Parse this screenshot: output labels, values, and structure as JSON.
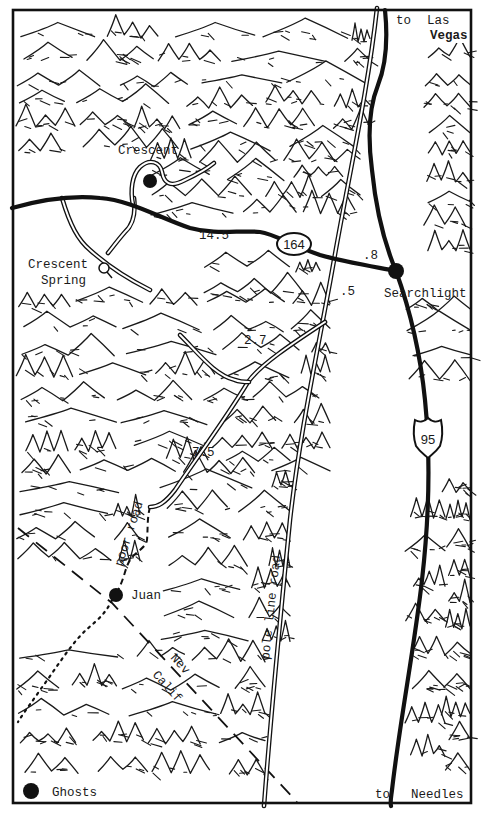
{
  "map": {
    "width": 487,
    "height": 814,
    "colors": {
      "ink": "#111111",
      "paper": "#ffffff"
    },
    "places": [
      {
        "id": "crescent",
        "label": "Crescent",
        "x": 147,
        "y": 181,
        "marker": "town",
        "label_x": 118,
        "label_y": 154
      },
      {
        "id": "crescent-spring",
        "label_lines": [
          "Crescent",
          "Spring"
        ],
        "x": 104,
        "y": 268,
        "marker": "spring",
        "label_x": 28,
        "label_y": 268
      },
      {
        "id": "searchlight",
        "label": "Searchlight",
        "x": 396,
        "y": 271,
        "marker": "town",
        "label_x": 383,
        "label_y": 297
      },
      {
        "id": "juan",
        "label": "Juan",
        "x": 116,
        "y": 595,
        "marker": "town",
        "label_x": 130,
        "label_y": 600
      },
      {
        "id": "ghosts",
        "label": "Ghosts",
        "x": 31,
        "y": 791,
        "marker": "town",
        "label_x": 52,
        "label_y": 796
      }
    ],
    "direction_labels": {
      "to_las_vegas": {
        "line1": "to",
        "line2a": "Las",
        "line2b": "Vegas"
      },
      "to_needles": {
        "to": "to",
        "dest": "Needles"
      }
    },
    "distances": [
      {
        "label": "14.5",
        "x": 199,
        "y": 239
      },
      {
        "label": ".8",
        "x": 363,
        "y": 259
      },
      {
        "label": ".5",
        "x": 340,
        "y": 295
      },
      {
        "label": "2.7",
        "x": 244,
        "y": 344
      },
      {
        "label": "7.5",
        "x": 192,
        "y": 456
      }
    ],
    "shields": {
      "state_route": {
        "label": "164",
        "x": 294,
        "y": 245
      },
      "us_route": {
        "label": "95",
        "x": 428,
        "y": 433
      }
    },
    "road_labels": {
      "poor_road": "poor road",
      "pole_line_road": "pole line road"
    },
    "state_line_labels": {
      "nev": "Nev",
      "calif": "Calif"
    }
  }
}
